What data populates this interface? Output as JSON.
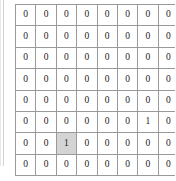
{
  "figure": {
    "type": "binary-matrix",
    "rows": 8,
    "cols": 8,
    "caption": "",
    "colors": {
      "cell_background": "#ffffff",
      "cell_border": "#9a9a9a",
      "highlight_background": "#d4d4d4",
      "text": "#1a1a1a"
    }
  },
  "matrix": {
    "values": [
      [
        "0",
        "0",
        "0",
        "0",
        "0",
        "0",
        "0",
        "0"
      ],
      [
        "0",
        "0",
        "0",
        "0",
        "0",
        "0",
        "0",
        "0"
      ],
      [
        "0",
        "0",
        "0",
        "0",
        "0",
        "0",
        "0",
        "0"
      ],
      [
        "0",
        "0",
        "0",
        "0",
        "0",
        "0",
        "0",
        "0"
      ],
      [
        "0",
        "0",
        "0",
        "0",
        "0",
        "0",
        "0",
        "0"
      ],
      [
        "0",
        "0",
        "0",
        "0",
        "0",
        "0",
        "1",
        "0"
      ],
      [
        "0",
        "0",
        "1",
        "0",
        "0",
        "0",
        "0",
        "0"
      ],
      [
        "0",
        "0",
        "0",
        "0",
        "0",
        "0",
        "0",
        "0"
      ]
    ],
    "highlighted": [
      {
        "row": 6,
        "col": 2
      }
    ]
  },
  "chart_data": {
    "type": "heatmap",
    "title": "",
    "xlabel": "",
    "ylabel": "",
    "categories": [
      "1",
      "2",
      "3",
      "4",
      "5",
      "6",
      "7",
      "8"
    ],
    "rows": [
      "1",
      "2",
      "3",
      "4",
      "5",
      "6",
      "7",
      "8"
    ],
    "values": [
      [
        0,
        0,
        0,
        0,
        0,
        0,
        0,
        0
      ],
      [
        0,
        0,
        0,
        0,
        0,
        0,
        0,
        0
      ],
      [
        0,
        0,
        0,
        0,
        0,
        0,
        0,
        0
      ],
      [
        0,
        0,
        0,
        0,
        0,
        0,
        0,
        0
      ],
      [
        0,
        0,
        0,
        0,
        0,
        0,
        0,
        0
      ],
      [
        0,
        0,
        0,
        0,
        0,
        0,
        1,
        0
      ],
      [
        0,
        0,
        1,
        0,
        0,
        0,
        0,
        0
      ],
      [
        0,
        0,
        0,
        0,
        0,
        0,
        0,
        0
      ]
    ],
    "annotations": [
      {
        "row": 5,
        "col": 6,
        "value": 1,
        "highlighted": false
      },
      {
        "row": 6,
        "col": 2,
        "value": 1,
        "highlighted": true
      }
    ],
    "grid": true,
    "legend": "none"
  }
}
